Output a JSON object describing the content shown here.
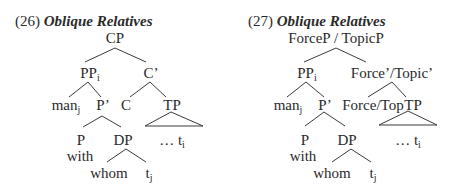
{
  "figures": [
    {
      "number": "(26)",
      "title": "Oblique Relatives",
      "nodes": {
        "root": "CP",
        "spec": "PP",
        "spec_sub": "i",
        "bar": "C’",
        "spec_left": "man",
        "spec_left_sub": "j",
        "pbar": "P’",
        "head": "C",
        "comp": "TP",
        "p": "P",
        "p_word": "with",
        "dp": "DP",
        "tp_content": "… t",
        "tp_content_sub": "i",
        "dp_left": "whom",
        "dp_right": "t",
        "dp_right_sub": "j"
      }
    },
    {
      "number": "(27)",
      "title": "Oblique Relatives",
      "nodes": {
        "root": "ForceP / TopicP",
        "spec": "PP",
        "spec_sub": "i",
        "bar": "Force’/Topic’",
        "spec_left": "man",
        "spec_left_sub": "j",
        "pbar": "P’",
        "head": "Force/Top",
        "comp": "TP",
        "p": "P",
        "p_word": "with",
        "dp": "DP",
        "tp_content": "… t",
        "tp_content_sub": "i",
        "dp_left": "whom",
        "dp_right": "t",
        "dp_right_sub": "j"
      }
    }
  ]
}
